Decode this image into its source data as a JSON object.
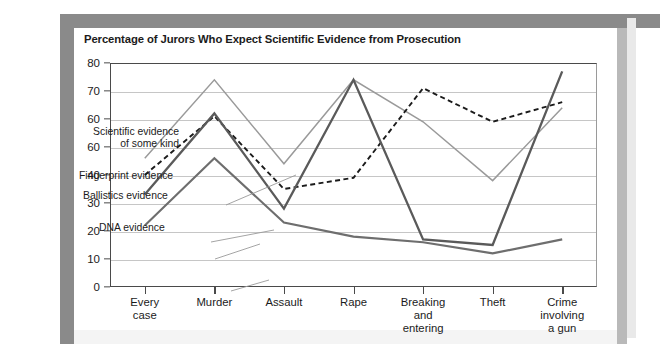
{
  "chart_data": {
    "type": "line",
    "title": "Percentage of Jurors Who Expect Scientific Evidence from Prosecution",
    "xlabel": "",
    "ylabel": "",
    "ylim": [
      0,
      80
    ],
    "yticks": [
      0,
      10,
      20,
      30,
      40,
      60,
      60,
      70,
      80
    ],
    "ytick_labels": [
      "0",
      "10",
      "20",
      "30",
      "40",
      "60",
      "60",
      "70",
      "80"
    ],
    "grid": true,
    "legend": "inline-annotations",
    "categories": [
      "Every case",
      "Murder",
      "Assault",
      "Rape",
      "Breaking and entering",
      "Theft",
      "Crime involving a gun"
    ],
    "series": [
      {
        "name": "Scientific evidence of some kind",
        "color": "#9a9a9a",
        "style": "solid",
        "values": [
          46,
          74,
          44,
          74,
          59,
          38,
          64
        ]
      },
      {
        "name": "Fingerprint evidence",
        "color": "#1b1b1b",
        "style": "dashed",
        "values": [
          40,
          61,
          35,
          39,
          71,
          59,
          66
        ]
      },
      {
        "name": "Ballistics evidence",
        "color": "#5a5a5a",
        "style": "solid",
        "values": [
          33,
          62,
          28,
          74,
          17,
          15,
          77
        ]
      },
      {
        "name": "DNA evidence",
        "color": "#6e6e6e",
        "style": "solid",
        "values": [
          22,
          46,
          23,
          18,
          16,
          12,
          17
        ]
      }
    ]
  },
  "labels": {
    "scientific_line1": "Scientific evidence",
    "scientific_line2": "of some kind",
    "fingerprint": "Fingerprint evidence",
    "ballistics": "Ballistics evidence",
    "dna": "DNA evidence"
  },
  "xaxis_labels": [
    [
      "Every",
      "case"
    ],
    [
      "Murder"
    ],
    [
      "Assault"
    ],
    [
      "Rape"
    ],
    [
      "Breaking",
      "and",
      "entering"
    ],
    [
      "Theft"
    ],
    [
      "Crime",
      "involving",
      "a gun"
    ]
  ]
}
